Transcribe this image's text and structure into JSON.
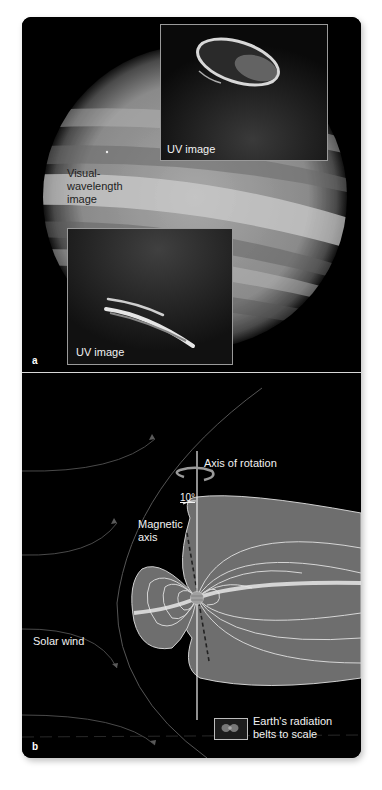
{
  "figure": {
    "panel_a": {
      "letter": "a",
      "visual_label": [
        "Visual-",
        "wavelength",
        "image"
      ],
      "uv_top_label": "UV image",
      "uv_bottom_label": "UV image"
    },
    "panel_b": {
      "letter": "b",
      "axis_of_rotation_label": "Axis of rotation",
      "tilt_angle_label": "10°",
      "magnetic_axis_label": [
        "Magnetic",
        "axis"
      ],
      "solar_wind_label": "Solar wind",
      "legend_label": [
        "Earth's radiation",
        "belts to scale"
      ]
    }
  },
  "colors": {
    "background": "#000000",
    "magnetosphere_fill": "#6e6e6e",
    "field_lines": "#d9d9d9",
    "label_text": "#f2f2f2",
    "planet_gray": "#9a9a9a"
  }
}
